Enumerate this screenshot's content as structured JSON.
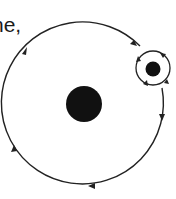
{
  "caption": {
    "fragment": "ne,",
    "top_fragment": "'"
  },
  "diagram": {
    "central_body": {
      "cx": 84,
      "cy": 104,
      "r": 18,
      "color": "#111111"
    },
    "main_orbit": {
      "cx": 84,
      "cy": 105,
      "r": 81,
      "direction": "clockwise",
      "stroke": "#222222"
    },
    "satellite": {
      "cx": 153,
      "cy": 69,
      "r": 8,
      "color": "#111111"
    },
    "satellite_orbit": {
      "cx": 153,
      "cy": 68,
      "r": 17,
      "stroke": "#222222"
    },
    "arrow_count_main": 5,
    "arrow_count_satellite": 4
  }
}
